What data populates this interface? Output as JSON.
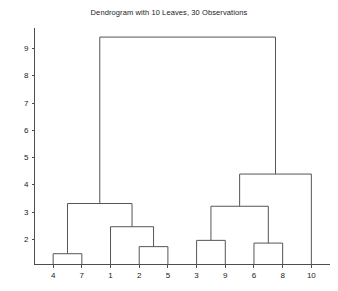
{
  "chart_data": {
    "type": "dendrogram",
    "title": "Dendrogram with 10 Leaves, 30 Observations",
    "xlabel": "",
    "ylabel": "",
    "grid": false,
    "legend": "none",
    "leaf_count": 10,
    "observation_count": 30,
    "leaf_labels": [
      "4",
      "7",
      "1",
      "2",
      "5",
      "3",
      "9",
      "6",
      "8",
      "10"
    ],
    "leaf_positions": [
      1,
      2,
      3,
      4,
      5,
      6,
      7,
      8,
      9,
      10
    ],
    "ytick_labels": [
      "2",
      "3",
      "4",
      "5",
      "6",
      "7",
      "8",
      "9"
    ],
    "yticks": [
      2,
      3,
      4,
      5,
      6,
      7,
      8,
      9
    ],
    "ylim": [
      0.95,
      9.85
    ],
    "xlim": [
      0.35,
      10.65
    ],
    "merges": [
      {
        "id": "m1",
        "label": "4 + 7",
        "left": "4",
        "right": "7",
        "height": 1.46,
        "x_left": 1,
        "x_right": 2,
        "x_center": 1.5
      },
      {
        "id": "m2",
        "label": "2 + 5",
        "left": "2",
        "right": "5",
        "height": 1.72,
        "x_left": 4,
        "x_right": 5,
        "x_center": 4.5
      },
      {
        "id": "m3",
        "label": "6 + 8",
        "left": "6",
        "right": "8",
        "height": 1.85,
        "x_left": 8,
        "x_right": 9,
        "x_center": 8.5
      },
      {
        "id": "m4",
        "label": "3 + 9",
        "left": "3",
        "right": "9",
        "height": 1.95,
        "x_left": 6,
        "x_right": 7,
        "x_center": 6.5
      },
      {
        "id": "m5",
        "label": "1 + (2,5)",
        "left": "1",
        "right": "m2",
        "height": 2.45,
        "x_left": 3,
        "x_right": 4.5,
        "x_center": 3.75
      },
      {
        "id": "m6",
        "label": "(3,9) + (6,8)",
        "left": "m4",
        "right": "m3",
        "height": 3.2,
        "x_left": 6.5,
        "x_right": 8.5,
        "x_center": 7.5
      },
      {
        "id": "m7",
        "label": "(4,7) + (1,2,5)",
        "left": "m1",
        "right": "m5",
        "height": 3.3,
        "x_left": 1.5,
        "x_right": 3.75,
        "x_center": 2.625
      },
      {
        "id": "m8",
        "label": "(3,9,6,8) + 10",
        "left": "m6",
        "right": "10",
        "height": 4.38,
        "x_left": 7.5,
        "x_right": 10,
        "x_center": 8.75
      },
      {
        "id": "m9",
        "label": "root",
        "left": "m7",
        "right": "m8",
        "height": 9.4,
        "x_left": 2.625,
        "x_right": 8.75,
        "x_center": 5.6875
      }
    ],
    "colors": {
      "link": "#555555",
      "axis": "#4d4d4d",
      "text": "#1a1a1a",
      "background": "#ffffff"
    }
  },
  "figure": {
    "width": 338,
    "height": 291
  }
}
